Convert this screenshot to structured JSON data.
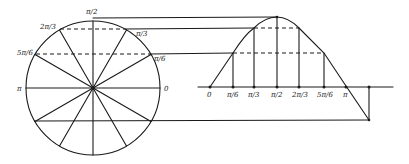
{
  "diagram": {
    "colors": {
      "ink": "#1a1a1a",
      "background": "#ffffff"
    },
    "circle": {
      "center": [
        93,
        88
      ],
      "radius": 67,
      "labels": {
        "top": "π/2",
        "upper_left_1": "2π/3",
        "upper_right_1": "π/3",
        "upper_left_2": "5π/6",
        "upper_right_2": "π/6",
        "left": "π",
        "right": "0"
      },
      "spoke_count": 12
    },
    "axis": {
      "y": 87,
      "x_start": 198,
      "x_end": 393,
      "ticks": [
        {
          "label": "0",
          "x": 210
        },
        {
          "label": "π/6",
          "x": 233
        },
        {
          "label": "π/3",
          "x": 254
        },
        {
          "label": "π/2",
          "x": 277
        },
        {
          "label": "2π/3",
          "x": 299
        },
        {
          "label": "5π/6",
          "x": 324
        },
        {
          "label": "π",
          "x": 346
        }
      ]
    },
    "curve": {
      "type": "sine",
      "description": "y = sin(x), traced from 0 through π and beyond"
    }
  }
}
